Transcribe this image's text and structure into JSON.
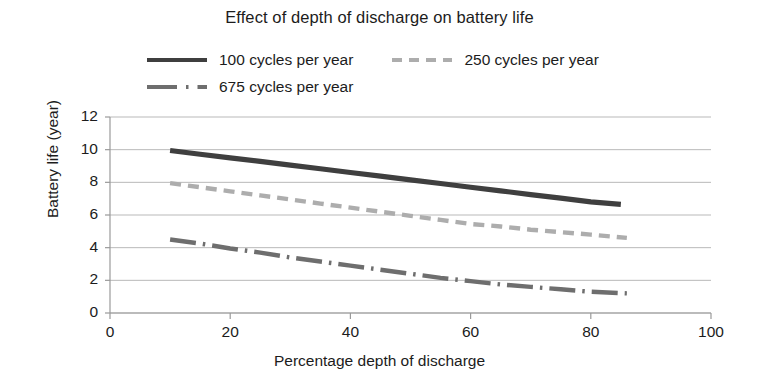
{
  "chart_data": {
    "type": "line",
    "title": "Effect of depth of discharge on battery life",
    "xlabel": "Percentage depth of discharge",
    "ylabel": "Battery life (year)",
    "xlim": [
      0,
      100
    ],
    "ylim": [
      0,
      12
    ],
    "xticks": [
      0,
      20,
      40,
      60,
      80,
      100
    ],
    "yticks": [
      0,
      2,
      4,
      6,
      8,
      10,
      12
    ],
    "grid": "horizontal",
    "legend_position": "top",
    "series": [
      {
        "name": "100 cycles per year",
        "style": "solid",
        "color": "#3f3f3f",
        "x": [
          10,
          15,
          20,
          25,
          30,
          35,
          40,
          45,
          50,
          55,
          60,
          65,
          70,
          75,
          80,
          85
        ],
        "values": [
          9.95,
          9.72,
          9.5,
          9.28,
          9.05,
          8.83,
          8.6,
          8.38,
          8.15,
          7.93,
          7.7,
          7.48,
          7.25,
          7.03,
          6.8,
          6.65
        ]
      },
      {
        "name": "250 cycles per year",
        "style": "dashed",
        "color": "#adadad",
        "x": [
          10,
          15,
          20,
          25,
          30,
          35,
          40,
          45,
          50,
          55,
          60,
          65,
          70,
          75,
          80,
          86
        ],
        "values": [
          7.95,
          7.7,
          7.45,
          7.2,
          6.95,
          6.7,
          6.45,
          6.2,
          5.95,
          5.7,
          5.45,
          5.3,
          5.1,
          4.95,
          4.8,
          4.6
        ]
      },
      {
        "name": "675 cycles per year",
        "style": "dash-dot",
        "color": "#6e6e6e",
        "x": [
          10,
          15,
          20,
          25,
          30,
          35,
          40,
          45,
          50,
          55,
          60,
          65,
          70,
          75,
          80,
          86
        ],
        "values": [
          4.5,
          4.25,
          3.95,
          3.7,
          3.4,
          3.15,
          2.9,
          2.65,
          2.4,
          2.15,
          1.95,
          1.75,
          1.6,
          1.45,
          1.3,
          1.2
        ]
      }
    ]
  },
  "legend": {
    "rows": [
      [
        {
          "label": "100 cycles per year",
          "marker": "solid-line-swatch"
        },
        {
          "label": "250 cycles per year",
          "marker": "dashed-line-swatch"
        }
      ],
      [
        {
          "label": "675 cycles per year",
          "marker": "dash-dot-line-swatch"
        }
      ]
    ]
  }
}
